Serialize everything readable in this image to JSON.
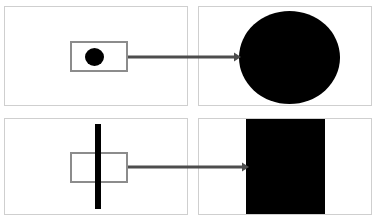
{
  "figure": {
    "title": "",
    "width": 380,
    "height": 223,
    "background_color": "#ffffff"
  },
  "palette": {
    "shape_fill": "#000000",
    "outline_gray": "#8c8c8c",
    "panel_border": "#cfcfcf",
    "arrow_gray": "#4d4d4d",
    "page_background": "#ffffff"
  },
  "panels": [
    {
      "id": "top-left",
      "role": "input",
      "label": "",
      "contents": [
        {
          "name": "source-rectangle",
          "shape": "rectangle",
          "fill": "#ffffff",
          "stroke": "#8c8c8c",
          "x": 70,
          "y": 41,
          "width": 58,
          "height": 31
        },
        {
          "name": "seed-dot",
          "shape": "circle",
          "fill": "#000000",
          "x": 85,
          "y": 48,
          "width": 19,
          "height": 18
        }
      ]
    },
    {
      "id": "top-right",
      "role": "output",
      "label": "",
      "contents": [
        {
          "name": "result-circle",
          "shape": "circle",
          "fill": "#000000",
          "x": 239,
          "y": 11,
          "width": 101,
          "height": 93
        }
      ]
    },
    {
      "id": "bottom-left",
      "role": "input",
      "label": "",
      "contents": [
        {
          "name": "source-rectangle",
          "shape": "rectangle",
          "fill": "#ffffff",
          "stroke": "#8c8c8c",
          "x": 70,
          "y": 152,
          "width": 58,
          "height": 31
        },
        {
          "name": "seed-bar",
          "shape": "rectangle",
          "fill": "#000000",
          "x": 95,
          "y": 124,
          "width": 6,
          "height": 85
        }
      ]
    },
    {
      "id": "bottom-right",
      "role": "output",
      "label": "",
      "contents": [
        {
          "name": "result-rectangle",
          "shape": "rectangle",
          "fill": "#000000",
          "x": 246,
          "y": 119,
          "width": 79,
          "height": 95
        }
      ]
    }
  ],
  "arrows": [
    {
      "name": "transform-arrow-top",
      "label": "",
      "from": {
        "x": 128,
        "y": 57
      },
      "to": {
        "x": 240,
        "y": 57
      },
      "color": "#4d4d4d",
      "direction": "right"
    },
    {
      "name": "transform-arrow-bottom",
      "label": "",
      "from": {
        "x": 128,
        "y": 167
      },
      "to": {
        "x": 248,
        "y": 167
      },
      "color": "#4d4d4d",
      "direction": "right"
    }
  ]
}
